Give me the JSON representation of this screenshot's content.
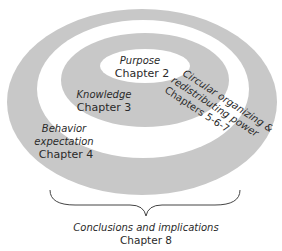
{
  "diagram": {
    "colors": {
      "ring": "#c8c8c8",
      "background": "#ffffff",
      "text": "#2a2a2a"
    },
    "center": {
      "title": "Purpose",
      "chapter": "Chapter 2"
    },
    "middle_ring": {
      "title": "Knowledge",
      "chapter": "Chapter 3"
    },
    "outer_white_ring": {
      "title_line1": "Behavior",
      "title_line2": "expectation",
      "chapter": "Chapter 4"
    },
    "diagonal_label": {
      "line1": "Circular organizing &",
      "line2": "redistributing power",
      "line3": "Chapters 5-6-7"
    },
    "footer": {
      "title": "Conclusions and implications",
      "chapter": "Chapter 8"
    }
  }
}
